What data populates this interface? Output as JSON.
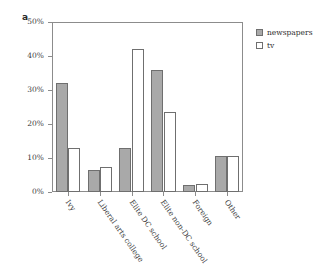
{
  "panel": {
    "letter": "a"
  },
  "legend": {
    "position": "right-top",
    "entries": [
      {
        "label": "newspapers",
        "color": "#a9a9a9",
        "style": "filled"
      },
      {
        "label": "tv",
        "color": "#ffffff",
        "style": "outline"
      }
    ]
  },
  "axis": {
    "y_ticks": [
      "0%",
      "10%",
      "20%",
      "30%",
      "40%",
      "50%"
    ],
    "y_min": 0,
    "y_max": 50
  },
  "chart_data": {
    "type": "bar",
    "title": "",
    "subtitle": "",
    "xlabel": "",
    "ylabel": "",
    "ylim": [
      0,
      50
    ],
    "ytick_labels": [
      "0%",
      "10%",
      "20%",
      "30%",
      "40%",
      "50%"
    ],
    "ytick_values": [
      0,
      10,
      20,
      30,
      40,
      50
    ],
    "grid": false,
    "legend_position": "right-top",
    "categories": [
      "Ivy",
      "Liberal arts college",
      "Elite DC school",
      "Elite non-DC school",
      "Foreign",
      "Other"
    ],
    "series": [
      {
        "name": "newspapers",
        "color": "#a9a9a9",
        "values": [
          32,
          6.5,
          13,
          36,
          2,
          10.5
        ]
      },
      {
        "name": "tv",
        "color": "#ffffff",
        "values": [
          13,
          7.5,
          42,
          23.5,
          2.5,
          10.5
        ]
      }
    ]
  }
}
